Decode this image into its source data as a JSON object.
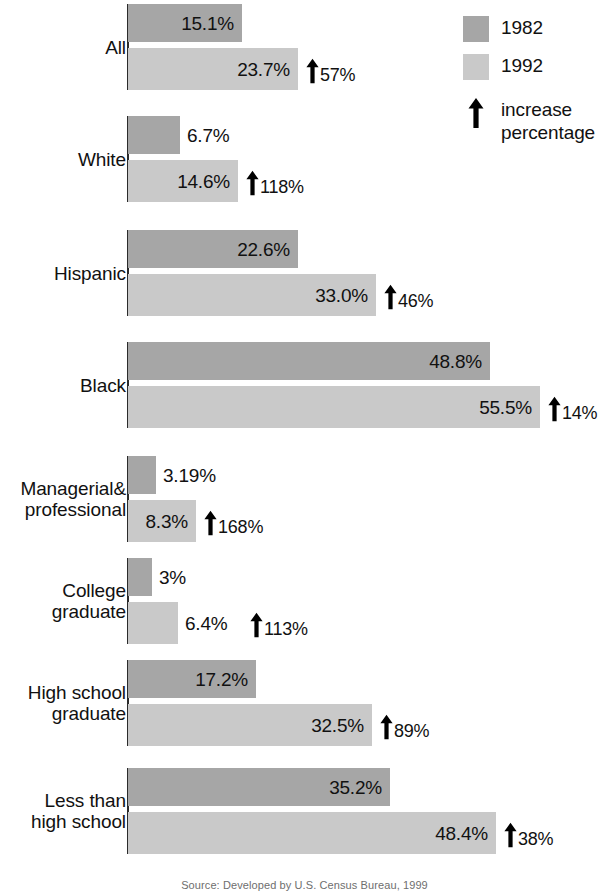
{
  "chart_data": {
    "type": "bar",
    "orientation": "horizontal",
    "title": "",
    "xlabel": "",
    "ylabel": "",
    "xlim": [
      0,
      60
    ],
    "grid": false,
    "legend_position": "top-right",
    "value_suffix": "%",
    "categories": [
      "All",
      "White",
      "Hispanic",
      "Black",
      "Managerial&\nprofessional",
      "College\ngraduate",
      "High school\ngraduate",
      "Less than\nhigh school"
    ],
    "series": [
      {
        "name": "1982",
        "color": "#a6a6a6",
        "values": [
          15.1,
          6.7,
          22.6,
          48.8,
          3.19,
          3,
          17.2,
          35.2
        ],
        "labels": [
          "15.1%",
          "6.7%",
          "22.6%",
          "48.8%",
          "3.19%",
          "3%",
          "17.2%",
          "35.2%"
        ]
      },
      {
        "name": "1992",
        "color": "#c9c9c9",
        "values": [
          23.7,
          14.6,
          33.0,
          55.5,
          8.3,
          6.4,
          32.5,
          48.4
        ],
        "labels": [
          "23.7%",
          "14.6%",
          "33.0%",
          "55.5%",
          "8.3%",
          "6.4%",
          "32.5%",
          "48.4%"
        ]
      }
    ],
    "annotations": {
      "name": "increase percentage",
      "values": [
        57,
        118,
        46,
        14,
        168,
        113,
        89,
        38
      ],
      "labels": [
        "57%",
        "118%",
        "46%",
        "14%",
        "168%",
        "113%",
        "89%",
        "38%"
      ]
    }
  },
  "groups": [
    {
      "label": "All",
      "top": 4,
      "bar1982": {
        "value": "15.1%",
        "width": 114,
        "label_inside": true
      },
      "bar1992": {
        "value": "23.7%",
        "width": 170,
        "label_inside": true
      },
      "increase": {
        "value": "57%",
        "left": 306
      }
    },
    {
      "label": "White",
      "top": 116,
      "bar1982": {
        "value": "6.7%",
        "width": 52,
        "label_inside": false
      },
      "bar1992": {
        "value": "14.6%",
        "width": 110,
        "label_inside": true
      },
      "increase": {
        "value": "118%",
        "left": 246
      }
    },
    {
      "label": "Hispanic",
      "top": 230,
      "bar1982": {
        "value": "22.6%",
        "width": 170,
        "label_inside": true
      },
      "bar1992": {
        "value": "33.0%",
        "width": 248,
        "label_inside": true
      },
      "increase": {
        "value": "46%",
        "left": 384
      }
    },
    {
      "label": "Black",
      "top": 342,
      "bar1982": {
        "value": "48.8%",
        "width": 362,
        "label_inside": true
      },
      "bar1992": {
        "value": "55.5%",
        "width": 412,
        "label_inside": true
      },
      "increase": {
        "value": "14%",
        "left": 548
      }
    },
    {
      "label": "Managerial&\nprofessional",
      "top": 456,
      "bar1982": {
        "value": "3.19%",
        "width": 28,
        "label_inside": false
      },
      "bar1992": {
        "value": "8.3%",
        "width": 68,
        "label_inside": true
      },
      "increase": {
        "value": "168%",
        "left": 204
      }
    },
    {
      "label": "College\ngraduate",
      "top": 558,
      "bar1982": {
        "value": "3%",
        "width": 24,
        "label_inside": false
      },
      "bar1992": {
        "value": "6.4%",
        "width": 50,
        "label_inside": false
      },
      "increase": {
        "value": "113%",
        "left": 250
      }
    },
    {
      "label": "High school\ngraduate",
      "top": 660,
      "bar1982": {
        "value": "17.2%",
        "width": 128,
        "label_inside": true
      },
      "bar1992": {
        "value": "32.5%",
        "width": 244,
        "label_inside": true
      },
      "increase": {
        "value": "89%",
        "left": 380
      }
    },
    {
      "label": "Less than\nhigh school",
      "top": 768,
      "bar1982": {
        "value": "35.2%",
        "width": 262,
        "label_inside": true
      },
      "bar1992": {
        "value": "48.4%",
        "width": 368,
        "label_inside": true
      },
      "increase": {
        "value": "38%",
        "left": 504
      }
    }
  ],
  "legend": {
    "item_1982": "1982",
    "item_1992": "1992",
    "item_increase": "increase\npercentage"
  },
  "caption": "Source: Developed by U.S. Census Bureau, 1999",
  "colors": {
    "series_1982": "#a6a6a6",
    "series_1992": "#c9c9c9",
    "arrow": "#000000",
    "text": "#111111",
    "background": "#ffffff"
  }
}
